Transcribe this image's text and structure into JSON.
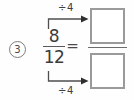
{
  "item": {
    "number_label": "3",
    "kind": "equivalent-fraction-exercise"
  },
  "fraction": {
    "numerator": "8",
    "denominator": "12"
  },
  "relation": {
    "equals_symbol": "="
  },
  "operations": {
    "top": {
      "label": "÷4",
      "applies_to": "numerator"
    },
    "bottom": {
      "label": "÷4",
      "applies_to": "denominator"
    }
  },
  "answer": {
    "numerator_value": "",
    "denominator_value": ""
  },
  "colors": {
    "ink": "#3b3b3b",
    "box_border": "#9a9a9a",
    "rule": "#6d6d6d",
    "background": "#fefefe"
  }
}
